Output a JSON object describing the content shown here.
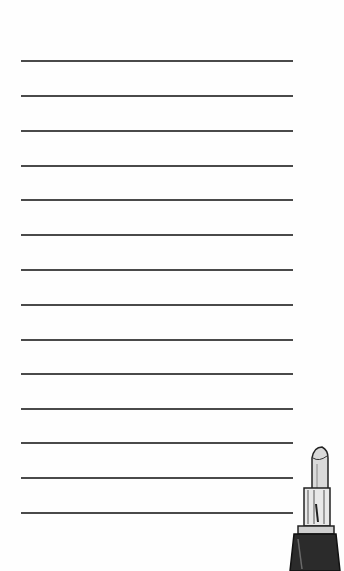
{
  "notepad": {
    "line_count": 14,
    "line_positions_y": [
      60,
      95,
      130,
      165,
      199,
      234,
      269,
      304,
      339,
      373,
      408,
      442,
      477,
      512
    ],
    "line_color": "#4a4a4a",
    "background_color": "#fefefe"
  },
  "decoration": {
    "icon": "lipstick-icon"
  }
}
